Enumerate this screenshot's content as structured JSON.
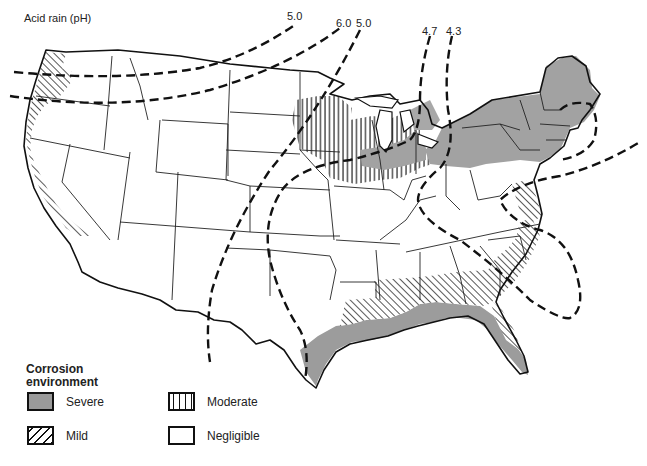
{
  "title": "Acid rain (pH)",
  "isopleths": [
    {
      "label": "5.0",
      "x": 287,
      "y": 10
    },
    {
      "label": "6.0",
      "x": 336,
      "y": 17
    },
    {
      "label": "5.0",
      "x": 356,
      "y": 17
    },
    {
      "label": "4.7",
      "x": 422,
      "y": 25
    },
    {
      "label": "4.3",
      "x": 446,
      "y": 25
    }
  ],
  "legend": {
    "title_line1": "Corrosion",
    "title_line2": "environment",
    "items": [
      {
        "label": "Severe",
        "pattern": "solid-gray",
        "color": "#9a9a9a"
      },
      {
        "label": "Moderate",
        "pattern": "vertical-lines"
      },
      {
        "label": "Mild",
        "pattern": "diagonal-lines"
      },
      {
        "label": "Negligible",
        "pattern": "blank"
      }
    ]
  },
  "regions": {
    "severe": [
      "Northeast (NY, PA, New England)",
      "Lower Great Lakes shoreline",
      "Gulf Coast (TX to FL)",
      "Florida peninsula"
    ],
    "moderate": [
      "Upper Midwest / Great Lakes (WI, MI, northern IL, IN, OH)"
    ],
    "mild": [
      "Pacific coast (WA, OR, CA)",
      "Southeast (LA, MS, AL, GA, SC)",
      "Mid-Atlantic coast (MD, VA, NC)"
    ],
    "negligible": [
      "Interior West",
      "Great Plains",
      "Central South"
    ]
  }
}
